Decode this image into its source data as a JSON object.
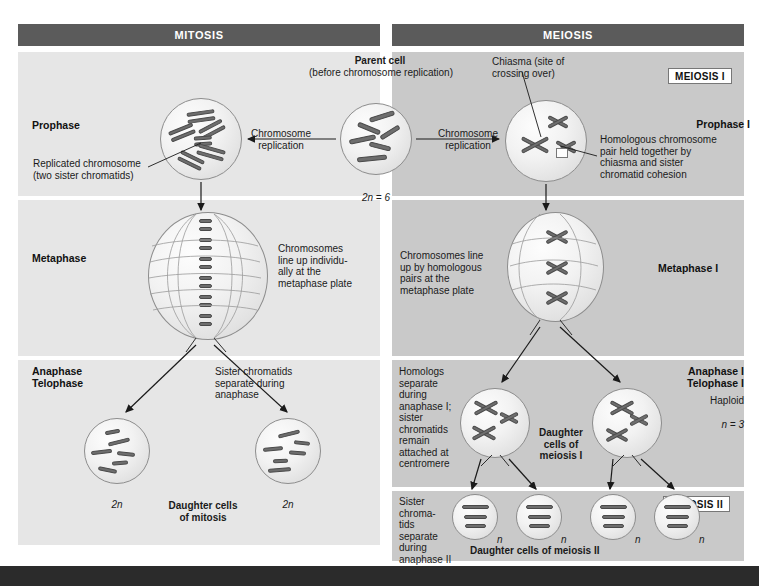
{
  "headers": {
    "mitosis": "MITOSIS",
    "meiosis": "MEIOSIS"
  },
  "badges": {
    "meiosis_1": "MEIOSIS I",
    "meiosis_2": "MEIOSIS II"
  },
  "parent": {
    "title": "Parent cell",
    "subtitle": "(before chromosome replication)",
    "ploidy": "2n = 6"
  },
  "arrows": {
    "replication_left": "Chromosome\nreplication",
    "replication_right": "Chromosome\nreplication"
  },
  "mitosis": {
    "prophase": {
      "stage": "Prophase",
      "callout": "Replicated chromosome\n(two sister chromatids)"
    },
    "metaphase": {
      "stage": "Metaphase",
      "note": "Chromosomes\nline up individu-\nally at the\nmetaphase plate"
    },
    "anaphase": {
      "stage": "Anaphase\nTelophase",
      "note": "Sister chromatids\nseparate during\nanaphase",
      "daughter_caption": "Daughter cells\nof mitosis",
      "ploidy_left": "2n",
      "ploidy_right": "2n"
    }
  },
  "meiosis": {
    "prophase1": {
      "stage": "Prophase I",
      "chiasma_callout": "Chiasma (site of\ncrossing over)",
      "note": "Homologous chromosome\npair held together by\nchiasma and sister\nchromatid cohesion"
    },
    "metaphase1": {
      "stage": "Metaphase I",
      "note": "Chromosomes line\nup by homologous\npairs at the\nmetaphase plate"
    },
    "anaphase1": {
      "stage": "Anaphase I\nTelophase I",
      "note": "Homologs\nseparate\nduring\nanaphase I;\nsister\nchromatids\nremain\nattached at\ncentromere",
      "haploid_label": "Haploid",
      "haploid_n": "n = 3",
      "daughter_caption": "Daughter\ncells of\nmeiosis I"
    },
    "meiosis2": {
      "note": "Sister\nchroma-\ntids\nseparate\nduring\nanaphase II",
      "daughter_caption": "Daughter cells of meiosis II",
      "ploidy_labels": [
        "n",
        "n",
        "n",
        "n"
      ]
    }
  },
  "colors": {
    "header_bar": "#5b5b5b",
    "panel_left": "#e6e6e6",
    "panel_right": "#c9c9c9",
    "chromosome": "#6e6e6e",
    "bottom_bar": "#2b2b2b"
  }
}
